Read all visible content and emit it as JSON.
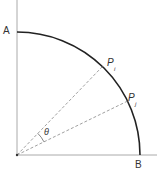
{
  "diagram": {
    "type": "quarter-circle",
    "labels": {
      "top_point": "A",
      "right_point": "B",
      "point_i": "P",
      "point_i_sub": "i",
      "point_j": "P",
      "point_j_sub": "j",
      "angle": "θ"
    },
    "angles_deg": {
      "point_i": 46,
      "point_j": 26
    },
    "colors": {
      "axis": "#999999",
      "arc": "#222222",
      "dashed": "#888888",
      "text": "#333333"
    }
  }
}
